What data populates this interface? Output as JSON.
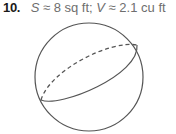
{
  "problem": {
    "number": "10.",
    "surface_var": "S",
    "surface_value": "≈ 8 sq ft;",
    "volume_var": "V",
    "volume_value": "≈ 2.1 cu ft"
  },
  "figure": {
    "shape": "sphere",
    "stroke_color": "#555555"
  }
}
